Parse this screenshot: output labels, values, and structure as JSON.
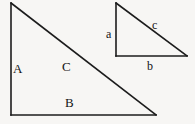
{
  "figure": {
    "background_color": "#f7f6f4",
    "line_color": "#1c1c1c",
    "text_color": "#141414",
    "shapes": [
      {
        "name": "large-right-triangle",
        "size": "large",
        "right_angle_at": "bottom-left",
        "vertices": {
          "top": [
            11,
            3
          ],
          "bottom_left": [
            11,
            115
          ],
          "bottom_right": [
            156,
            115
          ]
        },
        "edges": [
          {
            "id": "A",
            "label": "A",
            "role": "vertical-leg",
            "from": "top",
            "to": "bottom_left"
          },
          {
            "id": "B",
            "label": "B",
            "role": "horizontal-leg",
            "from": "bottom_left",
            "to": "bottom_right"
          },
          {
            "id": "C",
            "label": "C",
            "role": "hypotenuse",
            "from": "top",
            "to": "bottom_right"
          }
        ]
      },
      {
        "name": "small-right-triangle",
        "size": "small",
        "right_angle_at": "bottom-left",
        "vertices": {
          "top": [
            116,
            3
          ],
          "bottom_left": [
            116,
            56
          ],
          "bottom_right": [
            187,
            56
          ]
        },
        "edges": [
          {
            "id": "a",
            "label": "a",
            "role": "vertical-leg",
            "from": "top",
            "to": "bottom_left"
          },
          {
            "id": "b",
            "label": "b",
            "role": "horizontal-leg",
            "from": "bottom_left",
            "to": "bottom_right"
          },
          {
            "id": "c",
            "label": "c",
            "role": "hypotenuse",
            "from": "top",
            "to": "bottom_right"
          }
        ]
      }
    ]
  },
  "labels": {
    "large": {
      "A": "A",
      "B": "B",
      "C": "C"
    },
    "small": {
      "a": "a",
      "b": "b",
      "c": "c"
    }
  }
}
